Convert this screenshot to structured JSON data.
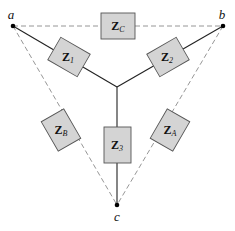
{
  "diagram": {
    "type": "Y-Delta impedance network",
    "nodes": [
      {
        "id": "a",
        "label": "a"
      },
      {
        "id": "b",
        "label": "b"
      },
      {
        "id": "c",
        "label": "c"
      }
    ],
    "wye_impedances": [
      {
        "id": "Z1",
        "base": "Z",
        "sub": "1",
        "between": [
          "a",
          "center"
        ]
      },
      {
        "id": "Z2",
        "base": "Z",
        "sub": "2",
        "between": [
          "b",
          "center"
        ]
      },
      {
        "id": "Z3",
        "base": "Z",
        "sub": "3",
        "between": [
          "c",
          "center"
        ]
      }
    ],
    "delta_impedances": [
      {
        "id": "ZC",
        "base": "Z",
        "sub": "C",
        "between": [
          "a",
          "b"
        ]
      },
      {
        "id": "ZB",
        "base": "Z",
        "sub": "B",
        "between": [
          "a",
          "c"
        ]
      },
      {
        "id": "ZA",
        "base": "Z",
        "sub": "A",
        "between": [
          "b",
          "c"
        ]
      }
    ],
    "colors": {
      "box_fill": "#d4d4d4",
      "box_stroke": "#555555",
      "wire": "#222222",
      "dashed": "#8a8a8a"
    }
  }
}
